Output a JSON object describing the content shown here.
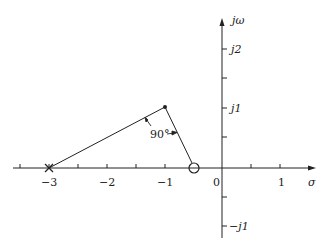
{
  "diagram": {
    "type": "s-plane pole-zero plot",
    "axes": {
      "real_label": "σ",
      "imag_label": "jω",
      "real_ticks": [
        {
          "value": -3,
          "label": "−3"
        },
        {
          "value": -2,
          "label": "−2"
        },
        {
          "value": -1,
          "label": "−1"
        },
        {
          "value": 0,
          "label": "0"
        },
        {
          "value": 1,
          "label": "1"
        }
      ],
      "imag_ticks": [
        {
          "value": 2,
          "label": "j2"
        },
        {
          "value": 1,
          "label": "j1"
        },
        {
          "value": -1,
          "label": "−j1"
        }
      ]
    },
    "points": {
      "pole_marker": {
        "type": "cross",
        "re": -3,
        "im": 0
      },
      "test_point": {
        "type": "dot",
        "re": -1,
        "im": 1
      },
      "zero_marker": {
        "type": "circle",
        "re": -0.5,
        "im": 0
      }
    },
    "angle_annotation": "90°"
  }
}
